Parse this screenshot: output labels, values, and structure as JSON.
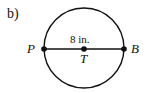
{
  "figure": {
    "part_label": "b)",
    "circle": {
      "cx": 84,
      "cy": 48,
      "r": 40
    },
    "diameter_label": "8 in.",
    "points": [
      {
        "name": "P",
        "role": "endpoint"
      },
      {
        "name": "T",
        "role": "center"
      },
      {
        "name": "B",
        "role": "endpoint"
      }
    ]
  }
}
